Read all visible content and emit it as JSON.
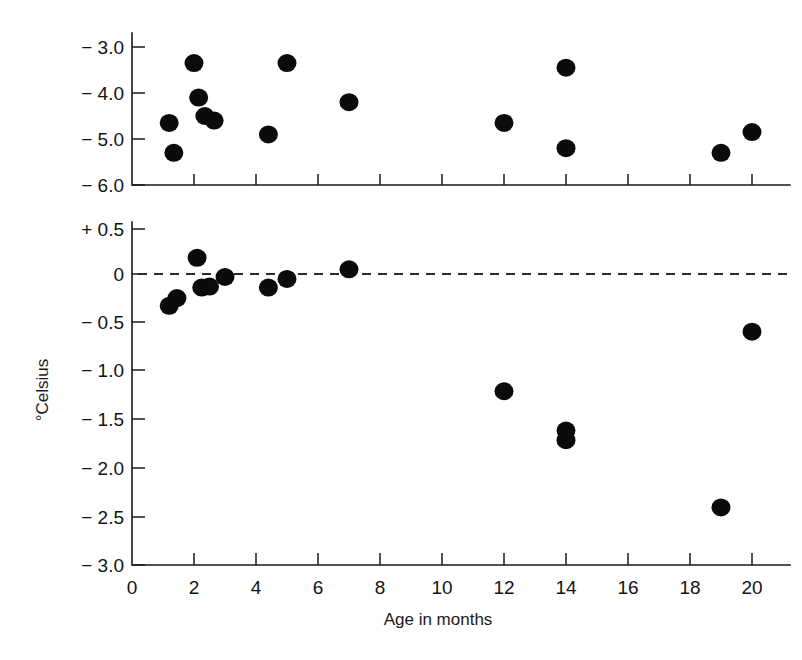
{
  "figure": {
    "background_color": "#ffffff",
    "ink_color": "#0b0b0b",
    "marker_shape": "filled-circle",
    "marker_color": "#0b0b0b",
    "zero_line_style": "dashed",
    "faint_scan_artifact": ""
  },
  "axes": {
    "x": {
      "label": "Age in months",
      "ticks": [
        "0",
        "2",
        "4",
        "6",
        "8",
        "10",
        "12",
        "14",
        "16",
        "18",
        "20"
      ],
      "tick_values": [
        0,
        2,
        4,
        6,
        8,
        10,
        12,
        14,
        16,
        18,
        20
      ],
      "min": 0,
      "max": 20.6
    },
    "y": {
      "label": "°Celsius",
      "top_panel_ticks": [
        "− 3.0",
        "− 4.0",
        "− 5.0",
        "− 6.0"
      ],
      "top_panel_tick_values": [
        -3.0,
        -4.0,
        -5.0,
        -6.0
      ],
      "bottom_panel_ticks": [
        "+ 0.5",
        "0",
        "− 0.5",
        "− 1.0",
        "− 1.5",
        "− 2.0",
        "− 2.5",
        "− 3.0"
      ],
      "bottom_panel_tick_values": [
        0.5,
        0.0,
        -0.5,
        -1.0,
        -1.5,
        -2.0,
        -2.5,
        -3.0
      ]
    }
  },
  "chart_data": [
    {
      "type": "scatter",
      "panel": "top",
      "title": "",
      "xlabel": "Age in months",
      "ylabel": "°Celsius",
      "xlim": [
        0,
        20.6
      ],
      "ylim": [
        -6.0,
        -2.7
      ],
      "grid": false,
      "legend": "none",
      "series": [
        {
          "name": "Temperature difference (upper panel)",
          "points": [
            {
              "x": 1.2,
              "y": -4.65
            },
            {
              "x": 1.35,
              "y": -5.3
            },
            {
              "x": 2.0,
              "y": -3.35
            },
            {
              "x": 2.15,
              "y": -4.1
            },
            {
              "x": 2.35,
              "y": -4.5
            },
            {
              "x": 2.65,
              "y": -4.6
            },
            {
              "x": 4.4,
              "y": -4.9
            },
            {
              "x": 5.0,
              "y": -3.35
            },
            {
              "x": 7.0,
              "y": -4.2
            },
            {
              "x": 12.0,
              "y": -4.65
            },
            {
              "x": 14.0,
              "y": -3.45
            },
            {
              "x": 14.0,
              "y": -5.2
            },
            {
              "x": 19.0,
              "y": -5.3
            },
            {
              "x": 20.0,
              "y": -4.85
            }
          ]
        }
      ]
    },
    {
      "type": "scatter",
      "panel": "bottom",
      "title": "",
      "xlabel": "Age in months",
      "ylabel": "°Celsius",
      "xlim": [
        0,
        20.6
      ],
      "ylim": [
        -3.0,
        0.5
      ],
      "grid": false,
      "legend": "none",
      "reference_line": {
        "value": 0.0,
        "style": "dashed"
      },
      "series": [
        {
          "name": "Temperature difference (lower panel)",
          "points": [
            {
              "x": 1.2,
              "y": -0.3
            },
            {
              "x": 1.45,
              "y": -0.22
            },
            {
              "x": 2.1,
              "y": 0.2
            },
            {
              "x": 2.25,
              "y": -0.11
            },
            {
              "x": 2.5,
              "y": -0.1
            },
            {
              "x": 3.0,
              "y": 0.0
            },
            {
              "x": 4.4,
              "y": -0.11
            },
            {
              "x": 5.0,
              "y": -0.02
            },
            {
              "x": 7.0,
              "y": 0.08
            },
            {
              "x": 12.0,
              "y": -1.19
            },
            {
              "x": 14.0,
              "y": -1.6
            },
            {
              "x": 14.0,
              "y": -1.7
            },
            {
              "x": 19.0,
              "y": -2.4
            },
            {
              "x": 20.0,
              "y": -0.57
            }
          ]
        }
      ]
    }
  ]
}
